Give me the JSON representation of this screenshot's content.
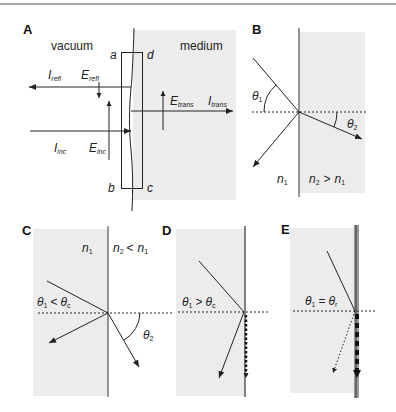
{
  "colors": {
    "background": "#ffffff",
    "shading": "#ececec",
    "line": "#222222",
    "top_rule": "#8a8a8a",
    "boundary_strip": "#9a9a9a"
  },
  "panels": {
    "A": {
      "label": "A",
      "regions": {
        "left": "vacuum",
        "right": "medium"
      },
      "corners": {
        "a": "a",
        "b": "b",
        "c": "c",
        "d": "d"
      },
      "beams": {
        "reflected_intensity": {
          "main": "I",
          "sub": "refl"
        },
        "reflected_field": {
          "main": "E",
          "sub": "refl"
        },
        "incident_intensity": {
          "main": "I",
          "sub": "inc"
        },
        "incident_field": {
          "main": "E",
          "sub": "inc"
        },
        "transmitted_field": {
          "main": "E",
          "sub": "trans"
        },
        "transmitted_intensity": {
          "main": "I",
          "sub": "trans"
        }
      }
    },
    "B": {
      "label": "B",
      "theta_incident": {
        "main": "θ",
        "sub": "1"
      },
      "theta_refracted": {
        "main": "θ",
        "sub": "2"
      },
      "n_left": {
        "main": "n",
        "sub": "1"
      },
      "n_right_rel": {
        "left_main": "n",
        "left_sub": "2",
        "op": ">",
        "right_main": "n",
        "right_sub": "1"
      }
    },
    "C": {
      "label": "C",
      "n_left": {
        "main": "n",
        "sub": "1"
      },
      "n_right_rel": {
        "left_main": "n",
        "left_sub": "2",
        "op": "<",
        "right_main": "n",
        "right_sub": "1"
      },
      "condition": {
        "l_main": "θ",
        "l_sub": "1",
        "op": "<",
        "r_main": "θ",
        "r_sub": "c"
      },
      "theta_refracted": {
        "main": "θ",
        "sub": "2"
      }
    },
    "D": {
      "label": "D",
      "condition": {
        "l_main": "θ",
        "l_sub": "1",
        "op": ">",
        "r_main": "θ",
        "r_sub": "c"
      }
    },
    "E": {
      "label": "E",
      "condition": {
        "l_main": "θ",
        "l_sub": "1",
        "op": "=",
        "r_main": "θ",
        "r_sub": "r"
      }
    }
  }
}
